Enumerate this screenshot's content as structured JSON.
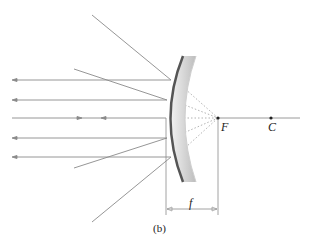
{
  "diagram": {
    "labels": {
      "focal_point": "F",
      "center_of_curvature": "C",
      "focal_length": "f",
      "caption": "(b)"
    },
    "colors": {
      "ray": "#8a8a8a",
      "dotted": "#9a9a9a",
      "axis": "#9a9a9a",
      "mirror_front": "#555555",
      "mirror_back": "#d0d0d0",
      "point": "#222222"
    },
    "points": {
      "F": [
        218,
        118
      ],
      "C": [
        271,
        118
      ]
    },
    "reflected_rays_y": [
      78,
      99,
      118,
      138,
      157
    ],
    "incident_rays_from": [
      [
        92,
        15
      ],
      [
        74,
        69
      ],
      [
        74,
        168
      ],
      [
        92,
        222
      ]
    ]
  }
}
